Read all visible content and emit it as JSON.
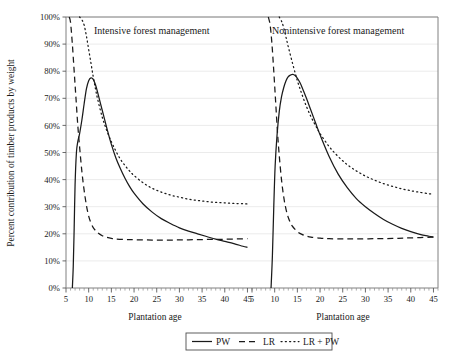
{
  "figure": {
    "ylabel": "Percent contribution of timber products by weight",
    "xlabel_left": "Plantation age",
    "xlabel_right": "Plantation age",
    "panel_left_title": "Intensive forest management",
    "panel_right_title": "Nonintensive forest management",
    "background_color": "#ffffff",
    "line_color": "#1a1a1a",
    "grid_color": "#e6e6e6",
    "axis_color": "#808080"
  },
  "legend": {
    "position": "bottom-center",
    "entries": [
      {
        "label": "PW",
        "style": "solid"
      },
      {
        "label": "LR",
        "style": "dashed"
      },
      {
        "label": "LR + PW",
        "style": "dotted"
      }
    ]
  },
  "yticks": [
    "0%",
    "10%",
    "20%",
    "30%",
    "40%",
    "50%",
    "60%",
    "70%",
    "80%",
    "90%",
    "100%"
  ],
  "xticks_left": [
    "5",
    "10",
    "15",
    "20",
    "25",
    "30",
    "35",
    "40",
    "45"
  ],
  "xticks_right": [
    "5",
    "10",
    "15",
    "20",
    "25",
    "30",
    "35",
    "40",
    "45"
  ],
  "chart_data": {
    "type": "line",
    "title": "",
    "xlabel": "Plantation age",
    "ylabel": "Percent contribution of timber products by weight",
    "ylim": [
      0,
      100
    ],
    "xlim": [
      5,
      46
    ],
    "grid": true,
    "legend_position": "bottom-center",
    "panels": [
      {
        "name": "Intensive forest management",
        "xlim": [
          5,
          46
        ],
        "series": [
          {
            "name": "PW",
            "style": "solid",
            "x": [
              6.4,
              6.6,
              6.8,
              7.0,
              7.3,
              7.6,
              8.0,
              8.5,
              9.0,
              9.5,
              10.0,
              10.5,
              11.0,
              11.5,
              12.0,
              13.0,
              14.0,
              15.0,
              16.0,
              17.0,
              18.0,
              19.0,
              20.0,
              22.0,
              24.0,
              26.0,
              28.0,
              30.0,
              32.0,
              34.0,
              36.0,
              38.0,
              40.0,
              42.0,
              44.0,
              45.0
            ],
            "y": [
              0.0,
              8.0,
              22.0,
              38.0,
              50.0,
              54.0,
              57.0,
              62.0,
              68.0,
              73.5,
              76.5,
              77.5,
              77.0,
              75.0,
              72.0,
              65.5,
              59.0,
              53.0,
              48.0,
              44.0,
              40.5,
              37.5,
              35.0,
              31.0,
              28.0,
              25.6,
              23.8,
              22.2,
              21.0,
              20.0,
              19.0,
              18.0,
              17.2,
              16.4,
              15.4,
              15.0
            ]
          },
          {
            "name": "LR",
            "style": "dashed",
            "x": [
              5.7,
              6.0,
              6.4,
              6.8,
              7.2,
              7.6,
              8.0,
              8.5,
              9.0,
              9.5,
              10.0,
              10.5,
              11.0,
              11.5,
              12.0,
              13.0,
              14.0,
              15.0,
              16.0,
              18.0,
              20.0,
              24.0,
              28.0,
              32.0,
              36.0,
              40.0,
              45.0
            ],
            "y": [
              100.0,
              98.0,
              90.0,
              80.0,
              70.0,
              60.0,
              52.0,
              43.0,
              36.0,
              30.5,
              26.5,
              24.0,
              22.3,
              21.2,
              20.4,
              19.3,
              18.7,
              18.3,
              18.1,
              17.9,
              17.8,
              17.7,
              17.7,
              17.8,
              17.9,
              18.0,
              18.2
            ]
          },
          {
            "name": "LR + PW",
            "style": "dotted",
            "x": [
              8.0,
              8.5,
              9.0,
              9.5,
              10.0,
              10.5,
              11.0,
              11.5,
              12.0,
              13.0,
              14.0,
              15.0,
              16.0,
              17.0,
              18.0,
              19.0,
              20.0,
              22.0,
              24.0,
              26.0,
              28.0,
              30.0,
              32.0,
              34.0,
              36.0,
              38.0,
              40.0,
              42.0,
              44.0,
              45.0
            ],
            "y": [
              100.0,
              99.0,
              97.0,
              93.0,
              88.0,
              83.0,
              78.0,
              73.5,
              69.5,
              63.0,
              58.0,
              54.0,
              50.5,
              47.5,
              45.2,
              43.2,
              41.5,
              38.8,
              36.8,
              35.4,
              34.3,
              33.5,
              32.8,
              32.3,
              31.9,
              31.6,
              31.4,
              31.2,
              31.1,
              31.0
            ]
          }
        ]
      },
      {
        "name": "Nonintensive forest management",
        "xlim": [
          5,
          46
        ],
        "series": [
          {
            "name": "PW",
            "style": "solid",
            "x": [
              9.2,
              9.5,
              9.8,
              10.1,
              10.5,
              11.0,
              11.5,
              12.0,
              12.5,
              13.0,
              13.5,
              14.0,
              14.5,
              15.0,
              15.5,
              16.0,
              17.0,
              18.0,
              19.0,
              20.0,
              22.0,
              24.0,
              26.0,
              28.0,
              30.0,
              32.0,
              34.0,
              36.0,
              38.0,
              40.0,
              42.0,
              44.0,
              45.0
            ],
            "y": [
              0.0,
              12.0,
              30.0,
              45.0,
              56.0,
              65.0,
              70.5,
              74.0,
              76.5,
              78.0,
              78.6,
              78.8,
              78.4,
              77.4,
              76.0,
              74.2,
              70.0,
              65.5,
              61.0,
              56.5,
              48.5,
              42.0,
              37.0,
              33.0,
              30.0,
              27.5,
              25.3,
              23.5,
              22.0,
              20.8,
              19.8,
              19.1,
              18.8
            ]
          },
          {
            "name": "LR",
            "style": "dashed",
            "x": [
              8.6,
              9.0,
              9.4,
              9.8,
              10.2,
              10.6,
              11.0,
              11.5,
              12.0,
              12.5,
              13.0,
              13.5,
              14.0,
              15.0,
              16.0,
              17.0,
              18.0,
              20.0,
              22.0,
              25.0,
              28.0,
              32.0,
              36.0,
              40.0,
              45.0
            ],
            "y": [
              100.0,
              97.0,
              90.0,
              80.0,
              69.0,
              58.0,
              49.0,
              40.0,
              33.5,
              29.0,
              26.0,
              24.0,
              22.6,
              20.8,
              19.8,
              19.2,
              18.8,
              18.4,
              18.2,
              18.1,
              18.1,
              18.2,
              18.3,
              18.5,
              18.8
            ]
          },
          {
            "name": "LR + PW",
            "style": "dotted",
            "x": [
              11.0,
              11.5,
              12.0,
              12.5,
              13.0,
              14.0,
              15.0,
              16.0,
              17.0,
              18.0,
              19.0,
              20.0,
              22.0,
              24.0,
              26.0,
              28.0,
              30.0,
              32.0,
              34.0,
              36.0,
              38.0,
              40.0,
              42.0,
              44.0,
              45.0
            ],
            "y": [
              100.0,
              98.5,
              96.0,
              92.5,
              89.0,
              82.5,
              76.5,
              71.5,
              67.0,
              63.2,
              60.0,
              57.0,
              52.2,
              48.5,
              45.5,
              43.2,
              41.3,
              39.8,
              38.5,
              37.5,
              36.6,
              35.9,
              35.3,
              34.8,
              34.6
            ]
          }
        ]
      }
    ]
  }
}
